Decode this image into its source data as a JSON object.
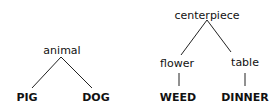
{
  "trees": [
    {
      "root": "animal",
      "children": [
        {
          "label": "PIG"
        },
        {
          "label": "DOG"
        }
      ]
    },
    {
      "root": "centerpiece",
      "children": [
        {
          "label": "flower",
          "child": "WEED"
        },
        {
          "label": "table",
          "child": "DINNER"
        }
      ]
    }
  ],
  "colors": {
    "line": "#222222",
    "text": "#111111",
    "background": "#ffffff"
  }
}
